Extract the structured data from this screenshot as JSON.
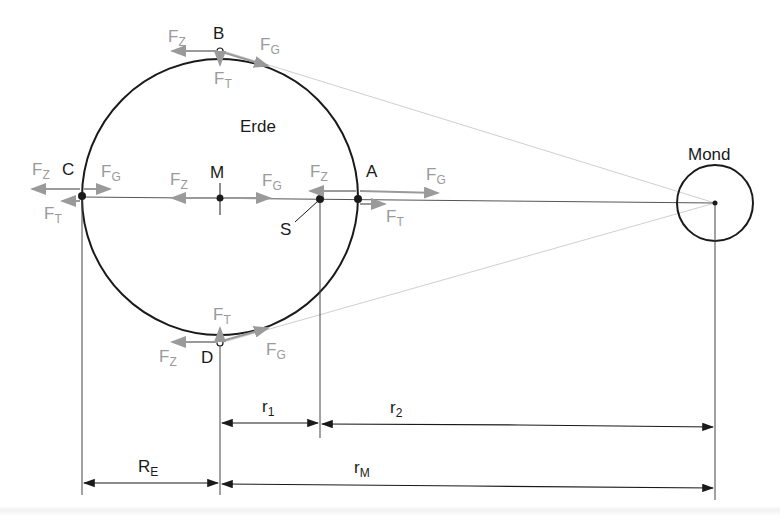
{
  "figure": {
    "earth_label": "Erde",
    "moon_label": "Mond",
    "points": {
      "A": "A",
      "B": "B",
      "C": "C",
      "D": "D",
      "M": "M",
      "S": "S"
    },
    "forces": {
      "centrifugal": "F",
      "centrifugal_sub": "Z",
      "gravitation": "F",
      "gravitation_sub": "G",
      "tidal": "F",
      "tidal_sub": "T"
    },
    "dimensions": {
      "r1": "r",
      "r1_sub": "1",
      "r2": "r",
      "r2_sub": "2",
      "RE": "R",
      "RE_sub": "E",
      "rM": "r",
      "rM_sub": "M"
    },
    "colors": {
      "outline": "#1a1a1a",
      "force_arrow": "#9a9a9a",
      "sight_line": "#cfcfcf"
    }
  }
}
